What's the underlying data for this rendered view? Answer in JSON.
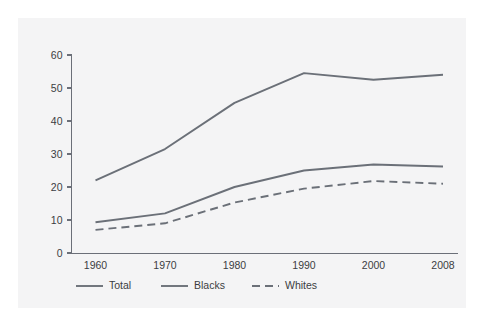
{
  "figure": {
    "panel_background": "#f4f4f5",
    "page_background": "#ffffff",
    "axis_color": "#6b6f78",
    "text_color": "#3b3d42"
  },
  "chart_data": {
    "type": "line",
    "title": "",
    "subtitle": "",
    "xlabel": "",
    "ylabel": "",
    "categories": [
      "1960",
      "1970",
      "1980",
      "1990",
      "2000",
      "2008"
    ],
    "x_tick_labels": [
      "1960",
      "1970",
      "1980",
      "1990",
      "2000",
      "2008"
    ],
    "y_tick_labels": [
      "0",
      "10",
      "20",
      "30",
      "40",
      "50",
      "60"
    ],
    "y_ticks": [
      0,
      10,
      20,
      30,
      40,
      50,
      60
    ],
    "ylim": [
      0,
      60
    ],
    "grid": false,
    "legend_position": "below-axis-left",
    "series": [
      {
        "name": "Total",
        "values": [
          22,
          31.5,
          45.5,
          54.5,
          52.5,
          54
        ],
        "style": "solid",
        "color": "#6b7078"
      },
      {
        "name": "Blacks",
        "values": [
          9.3,
          12,
          20,
          25,
          26.8,
          26.2
        ],
        "style": "solid",
        "color": "#6b7078"
      },
      {
        "name": "Whites",
        "values": [
          7,
          9,
          15.3,
          19.5,
          21.8,
          21
        ],
        "style": "dashed",
        "color": "#6b7078"
      }
    ],
    "legend": [
      {
        "label": "Total",
        "style": "solid",
        "color": "#6b7078"
      },
      {
        "label": "Blacks",
        "style": "solid",
        "color": "#6b7078"
      },
      {
        "label": "Whites",
        "style": "dashed",
        "color": "#6b7078"
      }
    ]
  }
}
